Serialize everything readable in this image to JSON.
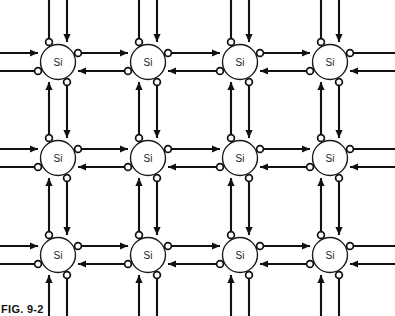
{
  "figure": {
    "caption": "FIG. 9-2",
    "atom_label": "Si",
    "colors": {
      "line": "#111111",
      "atom_stroke": "#1a1a1a",
      "background": "#ffffff",
      "text": "#111111"
    }
  },
  "lattice": {
    "columns": 4,
    "rows": 3,
    "column_x": [
      58,
      148,
      240,
      330
    ],
    "row_y": [
      62,
      158,
      255
    ],
    "atom_radius": 17.5,
    "atom_labels": [
      [
        "Si",
        "Si",
        "Si",
        "Si"
      ],
      [
        "Si",
        "Si",
        "Si",
        "Si"
      ],
      [
        "Si",
        "Si",
        "Si",
        "Si"
      ]
    ]
  },
  "bond_geometry": {
    "pair_offset": 9,
    "dot_radius": 3.4,
    "arrow_length": 8,
    "arrow_half_width": 3.6,
    "horizontal_bond_description": "upper arrow points right with electron dot at tail; lower arrow points left with electron dot at tail",
    "vertical_bond_description": "left arrow points up with electron dot at tail; right arrow points down with electron dot at tail"
  },
  "edges": {
    "top_description": "dangling bonds above top row: left line with dot at lower end, right arrow pointing down into atom",
    "bottom_description": "dangling bonds below bottom row: left arrow pointing up into atom, right line with dot at upper end",
    "left_description": "dangling bonds left of first column: upper arrow pointing right into atom, lower line with dot at inner end",
    "right_description": "dangling bonds right of last column: upper line with dot at inner end, lower arrow pointing left into atom"
  }
}
